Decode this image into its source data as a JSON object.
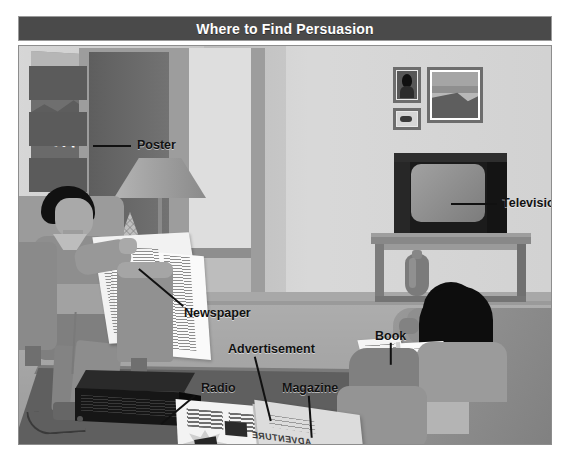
{
  "header": {
    "title": "Where to Find Persuasion"
  },
  "scene": {
    "name": "living-room-illustration",
    "poster_text": "EXICO",
    "magazine_cover_text": "ADVENTURE"
  },
  "labels": [
    {
      "id": "poster",
      "text": "Poster",
      "x": 118,
      "y": 92,
      "line": {
        "x": 74,
        "y": 99,
        "len": 38,
        "angle": 0
      }
    },
    {
      "id": "television",
      "text": "Television",
      "x": 483,
      "y": 150,
      "line": {
        "x": 432,
        "y": 157,
        "len": 46,
        "angle": 0
      }
    },
    {
      "id": "newspaper",
      "text": "Newspaper",
      "x": 165,
      "y": 260,
      "line": {
        "x": 120,
        "y": 222,
        "len": 58,
        "angle": 40
      }
    },
    {
      "id": "advertisement",
      "text": "Advertisement",
      "x": 209,
      "y": 296,
      "line": {
        "x": 236,
        "y": 310,
        "len": 66,
        "angle": 76
      }
    },
    {
      "id": "radio",
      "text": "Radio",
      "x": 182,
      "y": 335,
      "line": {
        "x": 176,
        "y": 349,
        "len": 44,
        "angle": 140
      }
    },
    {
      "id": "magazine",
      "text": "Magazine",
      "x": 263,
      "y": 335,
      "line": {
        "x": 290,
        "y": 349,
        "len": 42,
        "angle": 86
      }
    },
    {
      "id": "book",
      "text": "Book",
      "x": 356,
      "y": 283,
      "line": {
        "x": 372,
        "y": 296,
        "len": 22,
        "angle": 90
      }
    }
  ],
  "colors": {
    "titlebar_bg": "#4a4a4a",
    "titlebar_text": "#ffffff",
    "wall": "#d2d2d2",
    "floor": "#b0b0b0",
    "carpet": "#5f5f5f",
    "label_text": "#111111",
    "page_bg": "#ffffff"
  }
}
